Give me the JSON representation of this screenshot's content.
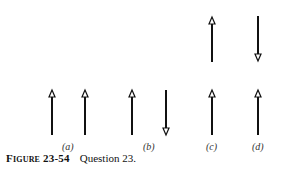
{
  "figure": {
    "caption_label": "Figure 23-54",
    "caption_text": "Question 23.",
    "panels": [
      {
        "label": "(a)",
        "arrows": [
          {
            "x": 52,
            "direction": "up"
          },
          {
            "x": 85,
            "direction": "up"
          }
        ]
      },
      {
        "label": "(b)",
        "arrows": [
          {
            "x": 132,
            "direction": "up"
          },
          {
            "x": 166,
            "direction": "down"
          }
        ]
      },
      {
        "label": "(c)",
        "arrows": [
          {
            "x": 212,
            "direction": "up",
            "row": "upper"
          },
          {
            "x": 212,
            "direction": "up",
            "row": "lower"
          }
        ]
      },
      {
        "label": "(d)",
        "arrows": [
          {
            "x": 258,
            "direction": "down",
            "row": "upper"
          },
          {
            "x": 258,
            "direction": "up",
            "row": "lower"
          }
        ]
      }
    ]
  }
}
